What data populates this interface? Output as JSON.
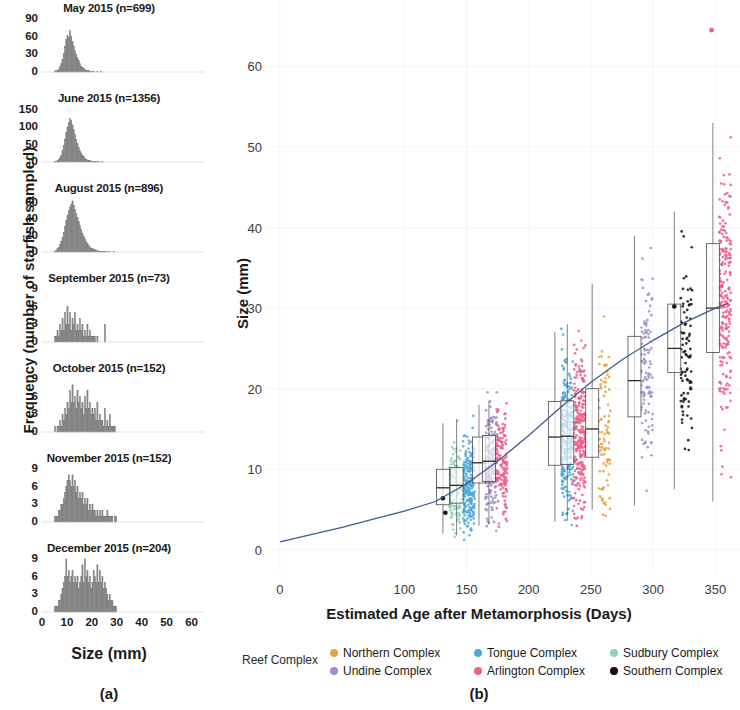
{
  "panel_a": {
    "tag": "(a)",
    "x_axis_label": "Size (mm)",
    "y_axis_label": "Frequency (number of starfish sampled)",
    "x_ticks": [
      0,
      10,
      20,
      30,
      40,
      50,
      60
    ],
    "x_range": [
      0,
      65
    ],
    "histograms": [
      {
        "title": "May 2015 (n=699)",
        "month": "May 2015",
        "n": 699,
        "y_ticks": [
          0,
          30,
          60,
          90
        ],
        "ylim": [
          0,
          95
        ],
        "bin_width": 0.5,
        "bin_start": 5.0,
        "counts": [
          1,
          2,
          3,
          5,
          9,
          14,
          22,
          31,
          44,
          55,
          62,
          58,
          70,
          61,
          52,
          44,
          36,
          30,
          24,
          19,
          14,
          10,
          8,
          6,
          4,
          3,
          2,
          2,
          1,
          1,
          1,
          1,
          0,
          0,
          1,
          0,
          0,
          1,
          0,
          0,
          0,
          0,
          0,
          0,
          0,
          0,
          0,
          0,
          0,
          0
        ]
      },
      {
        "title": "June 2015 (n=1356)",
        "month": "June 2015",
        "n": 1356,
        "y_ticks": [
          0,
          50,
          100,
          150
        ],
        "ylim": [
          0,
          160
        ],
        "bin_width": 0.5,
        "bin_start": 5.0,
        "counts": [
          1,
          2,
          4,
          7,
          12,
          20,
          32,
          48,
          66,
          84,
          100,
          112,
          124,
          118,
          106,
          92,
          78,
          64,
          52,
          42,
          33,
          26,
          20,
          15,
          11,
          8,
          6,
          5,
          4,
          3,
          2,
          2,
          1,
          1,
          1,
          1,
          0,
          0,
          1,
          0,
          0,
          0,
          0,
          0,
          0,
          0,
          0,
          0,
          0,
          0
        ]
      },
      {
        "title": "August 2015 (n=896)",
        "month": "August 2015",
        "n": 896,
        "y_ticks": [
          0,
          20,
          40,
          60
        ],
        "ylim": [
          0,
          68
        ],
        "bin_width": 0.5,
        "bin_start": 5.0,
        "counts": [
          1,
          2,
          4,
          6,
          9,
          13,
          18,
          24,
          31,
          38,
          44,
          50,
          54,
          58,
          62,
          57,
          52,
          47,
          42,
          37,
          32,
          27,
          23,
          19,
          16,
          13,
          10,
          8,
          6,
          5,
          4,
          3,
          3,
          2,
          2,
          1,
          1,
          1,
          1,
          1,
          1,
          0,
          1,
          0,
          1,
          0,
          0,
          1,
          0,
          0
        ]
      },
      {
        "title": "September 2015 (n=73)",
        "month": "September 2015",
        "n": 73,
        "y_ticks": [
          0,
          3,
          6,
          9
        ],
        "ylim": [
          0,
          9.5
        ],
        "bin_width": 0.5,
        "bin_start": 5.0,
        "counts": [
          1,
          1,
          2,
          1,
          3,
          2,
          4,
          2,
          5,
          3,
          6,
          3,
          5,
          2,
          4,
          3,
          5,
          2,
          3,
          2,
          4,
          2,
          3,
          1,
          2,
          1,
          3,
          1,
          2,
          1,
          1,
          1,
          1,
          0,
          1,
          0,
          0,
          0,
          0,
          0,
          3,
          0,
          0,
          0,
          0,
          0,
          0,
          0,
          0,
          0
        ]
      },
      {
        "title": "October 2015 (n=152)",
        "month": "October 2015",
        "n": 152,
        "y_ticks": [
          0,
          3,
          6,
          9
        ],
        "ylim": [
          0,
          9.5
        ],
        "bin_width": 0.5,
        "bin_start": 5.0,
        "counts": [
          1,
          0,
          1,
          1,
          2,
          1,
          3,
          2,
          4,
          3,
          5,
          4,
          7,
          5,
          8,
          5,
          6,
          4,
          7,
          5,
          6,
          4,
          5,
          3,
          6,
          4,
          7,
          4,
          5,
          3,
          4,
          3,
          4,
          2,
          5,
          2,
          3,
          2,
          2,
          1,
          4,
          1,
          2,
          1,
          3,
          1,
          1,
          1,
          1,
          0
        ]
      },
      {
        "title": "November 2015 (n=152)",
        "month": "November 2015",
        "n": 152,
        "y_ticks": [
          0,
          3,
          6,
          9
        ],
        "ylim": [
          0,
          9.5
        ],
        "bin_width": 0.5,
        "bin_start": 5.0,
        "counts": [
          1,
          1,
          1,
          2,
          2,
          3,
          3,
          4,
          5,
          6,
          7,
          8,
          7,
          6,
          8,
          6,
          7,
          5,
          6,
          4,
          5,
          4,
          5,
          3,
          4,
          3,
          4,
          2,
          3,
          2,
          3,
          2,
          2,
          1,
          2,
          1,
          2,
          1,
          2,
          1,
          1,
          1,
          2,
          1,
          1,
          1,
          1,
          0,
          1,
          1
        ]
      },
      {
        "title": "December 2015 (n=204)",
        "month": "December 2015",
        "n": 204,
        "y_ticks": [
          0,
          3,
          6,
          9
        ],
        "ylim": [
          0,
          9.5
        ],
        "bin_width": 0.5,
        "bin_start": 5.0,
        "counts": [
          1,
          1,
          1,
          2,
          2,
          3,
          4,
          5,
          6,
          9,
          6,
          7,
          5,
          6,
          7,
          5,
          6,
          5,
          6,
          4,
          5,
          6,
          8,
          5,
          9,
          6,
          7,
          5,
          6,
          4,
          5,
          7,
          6,
          5,
          8,
          5,
          7,
          5,
          6,
          4,
          5,
          4,
          3,
          2,
          3,
          2,
          2,
          1,
          1,
          1
        ]
      }
    ]
  },
  "panel_b": {
    "tag": "(b)",
    "x_axis_label": "Estimated Age after Metamorphosis (Days)",
    "y_axis_label": "Size (mm)",
    "x_ticks": [
      0,
      100,
      150,
      200,
      250,
      300,
      350
    ],
    "y_ticks": [
      0,
      10,
      20,
      30,
      40,
      50,
      60
    ],
    "xlim": [
      -8,
      365
    ],
    "ylim": [
      -3,
      67
    ],
    "legend_title": "Reef Complex",
    "legend": [
      {
        "label": "Northern Complex",
        "color": "#E9A23B"
      },
      {
        "label": "Tongue Complex",
        "color": "#4FA8D8"
      },
      {
        "label": "Sudbury Complex",
        "color": "#8CD3BB"
      },
      {
        "label": "Undine Complex",
        "color": "#A08DC8"
      },
      {
        "label": "Arlington Complex",
        "color": "#EF5E87"
      },
      {
        "label": "Southern Complex",
        "color": "#111111"
      }
    ],
    "trend_color": "#3B5C8F",
    "trend_label": "fitted growth curve",
    "trend_points": [
      [
        0,
        1.0
      ],
      [
        25,
        1.9
      ],
      [
        50,
        2.8
      ],
      [
        75,
        3.8
      ],
      [
        100,
        4.8
      ],
      [
        125,
        6.0
      ],
      [
        150,
        8.2
      ],
      [
        175,
        11.0
      ],
      [
        200,
        14.2
      ],
      [
        225,
        17.6
      ],
      [
        250,
        20.8
      ],
      [
        275,
        23.6
      ],
      [
        300,
        26.0
      ],
      [
        325,
        28.2
      ],
      [
        350,
        30.0
      ],
      [
        360,
        30.6
      ]
    ],
    "boxplots": [
      {
        "complex": "Sudbury Complex",
        "color": "#8CD3BB",
        "x": 131,
        "n": 120,
        "min": 2.0,
        "q1": 5.6,
        "median": 7.7,
        "q3": 10.0,
        "max": 15.7
      },
      {
        "complex": "Tongue Complex",
        "color": "#4FA8D8",
        "x": 142,
        "n": 230,
        "min": 1.8,
        "q1": 5.8,
        "median": 8.0,
        "q3": 10.2,
        "max": 16.2
      },
      {
        "complex": "Undine Complex",
        "color": "#A08DC8",
        "x": 160,
        "n": 170,
        "min": 3.0,
        "q1": 8.3,
        "median": 10.8,
        "q3": 14.0,
        "max": 18.0
      },
      {
        "complex": "Arlington Complex",
        "color": "#EF5E87",
        "x": 168,
        "n": 150,
        "min": 3.2,
        "q1": 8.5,
        "median": 11.0,
        "q3": 14.2,
        "max": 18.5
      },
      {
        "complex": "Tongue Complex",
        "color": "#4FA8D8",
        "x": 221,
        "n": 260,
        "min": 3.5,
        "q1": 10.5,
        "median": 14.0,
        "q3": 18.4,
        "max": 27.0
      },
      {
        "complex": "Arlington Complex",
        "color": "#EF5E87",
        "x": 231,
        "n": 260,
        "min": 3.6,
        "q1": 10.6,
        "median": 14.1,
        "q3": 18.5,
        "max": 28.0
      },
      {
        "complex": "Northern Complex",
        "color": "#E9A23B",
        "x": 251,
        "n": 90,
        "min": 5.0,
        "q1": 11.5,
        "median": 15.0,
        "q3": 20.0,
        "max": 33.0
      },
      {
        "complex": "Undine Complex",
        "color": "#A08DC8",
        "x": 285,
        "n": 110,
        "min": 5.5,
        "q1": 16.5,
        "median": 21.0,
        "q3": 26.5,
        "max": 39.0
      },
      {
        "complex": "Southern Complex",
        "color": "#111111",
        "x": 317,
        "n": 90,
        "min": 7.5,
        "q1": 22.0,
        "median": 25.0,
        "q3": 30.5,
        "max": 42.0
      },
      {
        "complex": "Arlington Complex",
        "color": "#EF5E87",
        "x": 348,
        "n": 230,
        "min": 6.0,
        "q1": 24.5,
        "median": 30.0,
        "q3": 38.0,
        "max": 53.0
      }
    ],
    "outliers": [
      {
        "complex": "Arlington Complex",
        "color": "#EF5E87",
        "x": 347,
        "y": 64.5
      },
      {
        "complex": "Southern Complex",
        "color": "#111111",
        "x": 317,
        "y": 30.2
      },
      {
        "complex": "Southern Complex",
        "color": "#111111",
        "x": 131,
        "y": 6.4
      },
      {
        "complex": "Southern Complex",
        "color": "#111111",
        "x": 133,
        "y": 4.6
      }
    ]
  }
}
